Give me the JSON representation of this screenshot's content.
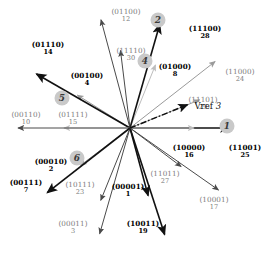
{
  "figure": {
    "type": "vector-diagram",
    "center": [
      130,
      128
    ],
    "reference_vector": {
      "label": "Vref",
      "sector_number": "3",
      "angle_deg": 22,
      "length": 62
    },
    "colors": {
      "dark": "#111111",
      "mid": "#4a4a4a",
      "light": "#9a9a9a",
      "lighter": "#bdbdbd",
      "badge_fill": "#c9c9c9",
      "background": "#ffffff"
    }
  },
  "vectors": [
    {
      "code": "(11001)",
      "dec": "25",
      "angle_deg": 0,
      "length": 100,
      "weight": "bold",
      "shade": "dark",
      "label_x": 245,
      "label_y": 151
    },
    {
      "code": "(10000)",
      "dec": "16",
      "angle_deg": 0,
      "length": 64,
      "weight": "bold",
      "shade": "lighter",
      "label_x": 189,
      "label_y": 151
    },
    {
      "code": "(11101)",
      "dec": "29",
      "angle_deg": 22,
      "length": 75,
      "weight": "faint",
      "shade": "light",
      "label_x": 203,
      "label_y": 103
    },
    {
      "code": "(11000)",
      "dec": "24",
      "angle_deg": 38,
      "length": 108,
      "weight": "faint",
      "shade": "light",
      "label_x": 240,
      "label_y": 75
    },
    {
      "code": "(01000)",
      "dec": "8",
      "angle_deg": 68,
      "length": 68,
      "weight": "bold",
      "shade": "lighter",
      "label_x": 175,
      "label_y": 70
    },
    {
      "code": "(11100)",
      "dec": "28",
      "angle_deg": 74,
      "length": 108,
      "weight": "bold",
      "shade": "dark",
      "label_x": 205,
      "label_y": 32
    },
    {
      "code": "(11110)",
      "dec": "30",
      "angle_deg": 97,
      "length": 78,
      "weight": "faint",
      "shade": "mid",
      "label_x": 131,
      "label_y": 54
    },
    {
      "code": "(01100)",
      "dec": "12",
      "angle_deg": 105,
      "length": 112,
      "weight": "faint",
      "shade": "mid",
      "label_x": 126,
      "label_y": 15
    },
    {
      "code": "(00100)",
      "dec": "4",
      "angle_deg": 148,
      "length": 62,
      "weight": "bold",
      "shade": "light",
      "label_x": 87,
      "label_y": 79
    },
    {
      "code": "(01110)",
      "dec": "14",
      "angle_deg": 150,
      "length": 108,
      "weight": "bold",
      "shade": "dark",
      "label_x": 48,
      "label_y": 48
    },
    {
      "code": "(01111)",
      "dec": "15",
      "angle_deg": 180,
      "length": 66,
      "weight": "faint",
      "shade": "lighter",
      "label_x": 73,
      "label_y": 118
    },
    {
      "code": "(00110)",
      "dec": "10",
      "angle_deg": 180,
      "length": 112,
      "weight": "faint",
      "shade": "mid",
      "label_x": 26,
      "label_y": 118
    },
    {
      "code": "(00010)",
      "dec": "2",
      "angle_deg": 217,
      "length": 62,
      "weight": "bold",
      "shade": "light",
      "label_x": 51,
      "label_y": 165
    },
    {
      "code": "(00111)",
      "dec": "7",
      "angle_deg": 218,
      "length": 105,
      "weight": "bold",
      "shade": "dark",
      "label_x": 26,
      "label_y": 186
    },
    {
      "code": "(10111)",
      "dec": "23",
      "angle_deg": 248,
      "length": 78,
      "weight": "faint",
      "shade": "mid",
      "label_x": 80,
      "label_y": 188
    },
    {
      "code": "(00011)",
      "dec": "3",
      "angle_deg": 254,
      "length": 110,
      "weight": "faint",
      "shade": "mid",
      "label_x": 73,
      "label_y": 227
    },
    {
      "code": "(00001)",
      "dec": "1",
      "angle_deg": 285,
      "length": 70,
      "weight": "bold",
      "shade": "dark",
      "label_x": 128,
      "label_y": 190
    },
    {
      "code": "(10011)",
      "dec": "19",
      "angle_deg": 288,
      "length": 112,
      "weight": "bold",
      "shade": "dark",
      "label_x": 143,
      "label_y": 227
    },
    {
      "code": "(11011)",
      "dec": "27",
      "angle_deg": 323,
      "length": 64,
      "weight": "faint",
      "shade": "mid",
      "label_x": 165,
      "label_y": 177
    },
    {
      "code": "(10001)",
      "dec": "17",
      "angle_deg": 325,
      "length": 108,
      "weight": "faint",
      "shade": "mid",
      "label_x": 214,
      "label_y": 203
    }
  ],
  "sector_badges": [
    {
      "label": "1",
      "x": 227,
      "y": 126
    },
    {
      "label": "2",
      "x": 158,
      "y": 20
    },
    {
      "label": "4",
      "x": 145,
      "y": 61
    },
    {
      "label": "5",
      "x": 62,
      "y": 98
    },
    {
      "label": "6",
      "x": 77,
      "y": 158
    }
  ]
}
